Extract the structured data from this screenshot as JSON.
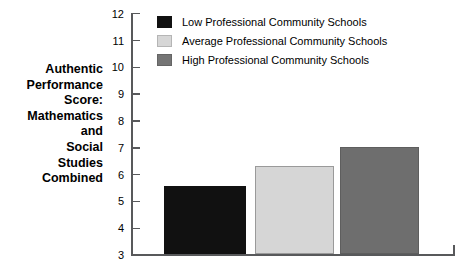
{
  "chart_data": {
    "type": "bar",
    "title": "",
    "xlabel": "",
    "ylabel": "Authentic\nPerformance\nScore:\nMathematics\nand\nSocial\nStudies\nCombined",
    "ylim": [
      3,
      12
    ],
    "ytick_labels": [
      "12",
      "11",
      "10",
      "9",
      "8",
      "7",
      "6",
      "5",
      "4",
      "3"
    ],
    "yticks": [
      12,
      11,
      10,
      9,
      8,
      7,
      6,
      5,
      4,
      3
    ],
    "grid": false,
    "legend_position": "top-left-inside",
    "categories": [
      "Low Professional Community Schools",
      "Average Professional Community Schools",
      "High Professional Community Schools"
    ],
    "values": [
      5.55,
      6.3,
      7.0
    ],
    "series": [
      {
        "name": "Low Professional Community Schools",
        "value": 5.55,
        "color": "#111111"
      },
      {
        "name": "Average Professional Community Schools",
        "value": 6.3,
        "color": "#d6d6d6"
      },
      {
        "name": "High Professional Community Schools",
        "value": 7.0,
        "color": "#6e6e6e"
      }
    ]
  },
  "legend": {
    "items": [
      {
        "label": "Low Professional Community Schools"
      },
      {
        "label": "Average Professional Community Schools"
      },
      {
        "label": "High Professional Community Schools"
      }
    ]
  },
  "axis": {
    "y_title": "Authentic\nPerformance\nScore:\nMathematics\nand\nSocial\nStudies\nCombined",
    "ticks": [
      {
        "label": "12"
      },
      {
        "label": "11"
      },
      {
        "label": "10"
      },
      {
        "label": "9"
      },
      {
        "label": "8"
      },
      {
        "label": "7"
      },
      {
        "label": "6"
      },
      {
        "label": "5"
      },
      {
        "label": "4"
      },
      {
        "label": "3"
      }
    ]
  },
  "colors": {
    "series_low": "#111111",
    "series_average": "#d6d6d6",
    "series_high": "#6e6e6e",
    "axis": "#58595b",
    "background": "#ffffff"
  }
}
